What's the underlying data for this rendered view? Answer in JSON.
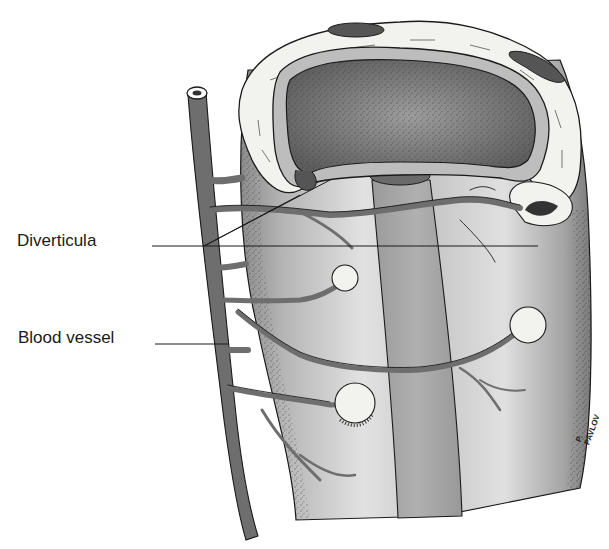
{
  "figure": {
    "labels": [
      {
        "id": "diverticula",
        "text": "Diverticula"
      },
      {
        "id": "blood_vessel",
        "text": "Blood vessel"
      }
    ],
    "signature": "P. PAVLOV",
    "colors": {
      "background": "#ffffff",
      "vessel": "#6e6e6e",
      "wall_light": "#d9d9d9",
      "wall_mid": "#a8a8a8",
      "lumen": "#8a8a8a",
      "serosa": "#f4f4f2",
      "ink": "#1a1a1a"
    }
  }
}
